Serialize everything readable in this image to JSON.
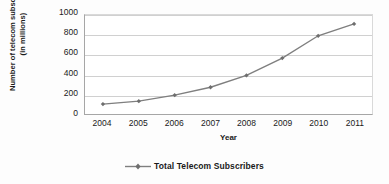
{
  "chart_data": {
    "type": "line",
    "title": "",
    "xlabel": "Year",
    "ylabel_line1": "Number of telecom subscribers",
    "ylabel_line2": "(in millions)",
    "categories": [
      "2004",
      "2005",
      "2006",
      "2007",
      "2008",
      "2009",
      "2010",
      "2011"
    ],
    "series": [
      {
        "name": "Total Telecom Subscribers",
        "values": [
          100,
          130,
          190,
          270,
          390,
          565,
          790,
          910
        ]
      }
    ],
    "ylim": [
      0,
      1000
    ],
    "yticks": [
      0,
      200,
      400,
      600,
      800,
      1000
    ],
    "ytick_labels": [
      "0",
      "200",
      "400",
      "600",
      "800",
      "1000"
    ],
    "grid": true,
    "legend_position": "bottom",
    "series_color": "#7f7f7f",
    "marker": "diamond",
    "plot_background": "#ffffff",
    "gridline_color": "#d0d0d0",
    "axis_color": "#a6a6a6",
    "text_color": "#1a1a1a"
  }
}
